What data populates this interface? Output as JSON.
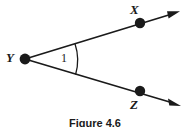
{
  "figure": {
    "caption": "Figure 4.6",
    "background_color": "#ffffff",
    "ink_color": "#1a1a1a",
    "vertex_label": "Y",
    "ray_point_upper_label": "X",
    "ray_point_lower_label": "Z",
    "angle_label": "1"
  },
  "geometry": {
    "vertex": {
      "name": "Y",
      "x": 25,
      "y": 59
    },
    "points": [
      {
        "name": "X",
        "x": 140,
        "y": 23
      },
      {
        "name": "Z",
        "x": 140,
        "y": 91
      }
    ],
    "rays": [
      {
        "from": "Y",
        "through": "X",
        "arrow_tip_x": 179,
        "arrow_tip_y": 12
      },
      {
        "from": "Y",
        "through": "Z",
        "arrow_tip_x": 180,
        "arrow_tip_y": 105
      }
    ],
    "arc": {
      "label": "1",
      "radius": 52
    }
  }
}
